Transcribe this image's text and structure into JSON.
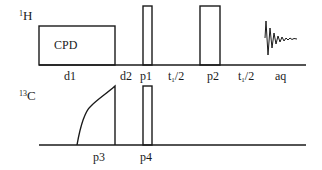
{
  "diagram": {
    "type": "NMR pulse sequence",
    "channels": [
      {
        "nucleus_mass": "1",
        "nucleus_symbol": "H",
        "elements": [
          {
            "name": "CPD",
            "kind": "decoupling-block"
          },
          {
            "name": "p1",
            "kind": "pulse"
          },
          {
            "name": "p2",
            "kind": "pulse"
          },
          {
            "name": "aq",
            "kind": "acquisition-fid"
          }
        ],
        "timing_labels": {
          "d1": "d1",
          "d2": "d2",
          "p1": "p1",
          "t1a_main": "t",
          "t1a_sub": "1",
          "t1a_rest": "/2",
          "p2": "p2",
          "t1b_main": "t",
          "t1b_sub": "1",
          "t1b_rest": "/2",
          "aq": "aq"
        },
        "block_label": "CPD"
      },
      {
        "nucleus_mass": "13",
        "nucleus_symbol": "C",
        "elements": [
          {
            "name": "p3",
            "kind": "adiabatic-shaped-pulse"
          },
          {
            "name": "p4",
            "kind": "pulse"
          }
        ],
        "timing_labels": {
          "p3": "p3",
          "p4": "p4"
        }
      }
    ],
    "colors": {
      "line": "#1a1a1a",
      "background": "#ffffff"
    }
  }
}
